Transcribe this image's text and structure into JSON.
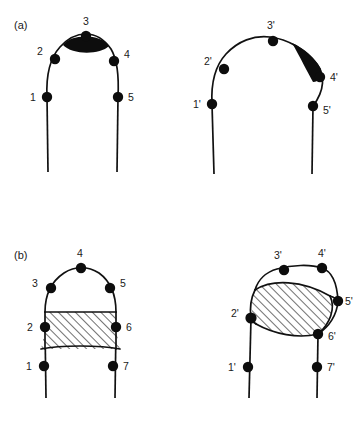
{
  "figure": {
    "background_color": "#ffffff",
    "ink_color": "#111111",
    "fill_color": "#0d0d0d",
    "panels": [
      {
        "id": "a",
        "label": "(a)",
        "label_x": 14,
        "label_y": 29,
        "shapes": [
          {
            "id": "a-left",
            "name": "symmetric-arch-with-apex-cap",
            "markers": [
              {
                "label": "1",
                "dot_x": 47,
                "dot_y": 97,
                "text_x": 30,
                "text_y": 101
              },
              {
                "label": "2",
                "dot_x": 55,
                "dot_y": 59,
                "text_x": 37,
                "text_y": 55
              },
              {
                "label": "3",
                "dot_x": 86,
                "dot_y": 36,
                "text_x": 83,
                "text_y": 25
              },
              {
                "label": "4",
                "dot_x": 114,
                "dot_y": 61,
                "text_x": 124,
                "text_y": 58
              },
              {
                "label": "5",
                "dot_x": 118,
                "dot_y": 97,
                "text_x": 128,
                "text_y": 101
              }
            ]
          },
          {
            "id": "a-right",
            "name": "tilted-arch-with-flank-cap",
            "markers": [
              {
                "label": "1'",
                "dot_x": 212,
                "dot_y": 104,
                "text_x": 193,
                "text_y": 108
              },
              {
                "label": "2'",
                "dot_x": 224,
                "dot_y": 69,
                "text_x": 204,
                "text_y": 65
              },
              {
                "label": "3'",
                "dot_x": 273,
                "dot_y": 41,
                "text_x": 267,
                "text_y": 29
              },
              {
                "label": "4'",
                "dot_x": 320,
                "dot_y": 77,
                "text_x": 330,
                "text_y": 81
              },
              {
                "label": "5'",
                "dot_x": 313,
                "dot_y": 106,
                "text_x": 323,
                "text_y": 114
              }
            ]
          }
        ]
      },
      {
        "id": "b",
        "label": "(b)",
        "label_x": 14,
        "label_y": 259,
        "shapes": [
          {
            "id": "b-left",
            "name": "symmetric-dome-with-hatched-band",
            "markers": [
              {
                "label": "1",
                "dot_x": 44,
                "dot_y": 366,
                "text_x": 26,
                "text_y": 370
              },
              {
                "label": "2",
                "dot_x": 45,
                "dot_y": 327,
                "text_x": 27,
                "text_y": 331
              },
              {
                "label": "3",
                "dot_x": 51,
                "dot_y": 288,
                "text_x": 32,
                "text_y": 287
              },
              {
                "label": "4",
                "dot_x": 81,
                "dot_y": 268,
                "text_x": 77,
                "text_y": 257
              },
              {
                "label": "5",
                "dot_x": 110,
                "dot_y": 288,
                "text_x": 120,
                "text_y": 287
              },
              {
                "label": "6",
                "dot_x": 116,
                "dot_y": 327,
                "text_x": 126,
                "text_y": 331
              },
              {
                "label": "7",
                "dot_x": 113,
                "dot_y": 366,
                "text_x": 123,
                "text_y": 370
              }
            ]
          },
          {
            "id": "b-right",
            "name": "tilted-dome-with-hatched-band",
            "markers": [
              {
                "label": "1'",
                "dot_x": 248,
                "dot_y": 367,
                "text_x": 228,
                "text_y": 371
              },
              {
                "label": "2'",
                "dot_x": 251,
                "dot_y": 318,
                "text_x": 231,
                "text_y": 317
              },
              {
                "label": "3'",
                "dot_x": 284,
                "dot_y": 270,
                "text_x": 274,
                "text_y": 259
              },
              {
                "label": "4'",
                "dot_x": 322,
                "dot_y": 268,
                "text_x": 318,
                "text_y": 257
              },
              {
                "label": "5'",
                "dot_x": 338,
                "dot_y": 301,
                "text_x": 345,
                "text_y": 305
              },
              {
                "label": "6'",
                "dot_x": 318,
                "dot_y": 334,
                "text_x": 328,
                "text_y": 340
              },
              {
                "label": "7'",
                "dot_x": 317,
                "dot_y": 367,
                "text_x": 327,
                "text_y": 371
              }
            ]
          }
        ]
      }
    ]
  }
}
